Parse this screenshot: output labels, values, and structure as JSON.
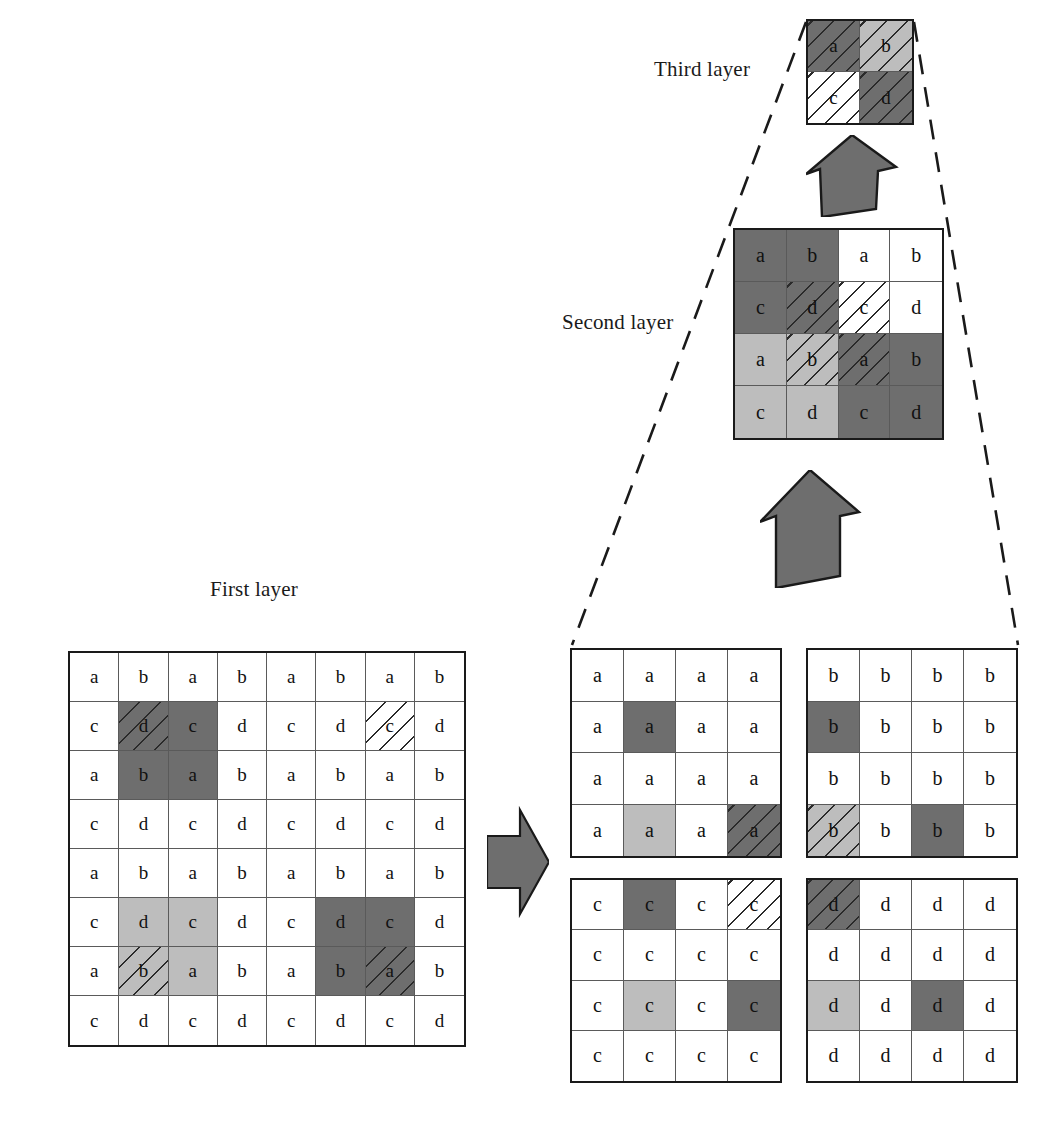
{
  "figure": {
    "labels": {
      "first_layer": "First layer",
      "second_layer": "Second layer",
      "third_layer": "Third layer"
    },
    "colors": {
      "white": "#ffffff",
      "light_gray": "#bdbdbd",
      "dark_gray": "#6e6e6e",
      "line": "#5a5a5a",
      "border": "#1a1a1a",
      "arrow_fill": "#6e6e6e",
      "arrow_stroke": "#1a1a1a"
    },
    "icons": {
      "arrow_right": "arrow-right-icon",
      "arrow_up": "arrow-up-icon",
      "projection_lines": "dashed-projection-lines"
    }
  },
  "chart_data": {
    "type": "diagram",
    "fill_legend": [
      "white",
      "light",
      "dark"
    ],
    "grids": {
      "first_layer": {
        "rows": 8,
        "cols": 8,
        "cells": [
          [
            {
              "t": "a",
              "f": "white",
              "h": false
            },
            {
              "t": "b",
              "f": "white",
              "h": false
            },
            {
              "t": "a",
              "f": "white",
              "h": false
            },
            {
              "t": "b",
              "f": "white",
              "h": false
            },
            {
              "t": "a",
              "f": "white",
              "h": false
            },
            {
              "t": "b",
              "f": "white",
              "h": false
            },
            {
              "t": "a",
              "f": "white",
              "h": false
            },
            {
              "t": "b",
              "f": "white",
              "h": false
            }
          ],
          [
            {
              "t": "c",
              "f": "white",
              "h": false
            },
            {
              "t": "d",
              "f": "dark",
              "h": true
            },
            {
              "t": "c",
              "f": "dark",
              "h": false
            },
            {
              "t": "d",
              "f": "white",
              "h": false
            },
            {
              "t": "c",
              "f": "white",
              "h": false
            },
            {
              "t": "d",
              "f": "white",
              "h": false
            },
            {
              "t": "c",
              "f": "white",
              "h": true
            },
            {
              "t": "d",
              "f": "white",
              "h": false
            }
          ],
          [
            {
              "t": "a",
              "f": "white",
              "h": false
            },
            {
              "t": "b",
              "f": "dark",
              "h": false
            },
            {
              "t": "a",
              "f": "dark",
              "h": false
            },
            {
              "t": "b",
              "f": "white",
              "h": false
            },
            {
              "t": "a",
              "f": "white",
              "h": false
            },
            {
              "t": "b",
              "f": "white",
              "h": false
            },
            {
              "t": "a",
              "f": "white",
              "h": false
            },
            {
              "t": "b",
              "f": "white",
              "h": false
            }
          ],
          [
            {
              "t": "c",
              "f": "white",
              "h": false
            },
            {
              "t": "d",
              "f": "white",
              "h": false
            },
            {
              "t": "c",
              "f": "white",
              "h": false
            },
            {
              "t": "d",
              "f": "white",
              "h": false
            },
            {
              "t": "c",
              "f": "white",
              "h": false
            },
            {
              "t": "d",
              "f": "white",
              "h": false
            },
            {
              "t": "c",
              "f": "white",
              "h": false
            },
            {
              "t": "d",
              "f": "white",
              "h": false
            }
          ],
          [
            {
              "t": "a",
              "f": "white",
              "h": false
            },
            {
              "t": "b",
              "f": "white",
              "h": false
            },
            {
              "t": "a",
              "f": "white",
              "h": false
            },
            {
              "t": "b",
              "f": "white",
              "h": false
            },
            {
              "t": "a",
              "f": "white",
              "h": false
            },
            {
              "t": "b",
              "f": "white",
              "h": false
            },
            {
              "t": "a",
              "f": "white",
              "h": false
            },
            {
              "t": "b",
              "f": "white",
              "h": false
            }
          ],
          [
            {
              "t": "c",
              "f": "white",
              "h": false
            },
            {
              "t": "d",
              "f": "light",
              "h": false
            },
            {
              "t": "c",
              "f": "light",
              "h": false
            },
            {
              "t": "d",
              "f": "white",
              "h": false
            },
            {
              "t": "c",
              "f": "white",
              "h": false
            },
            {
              "t": "d",
              "f": "dark",
              "h": false
            },
            {
              "t": "c",
              "f": "dark",
              "h": false
            },
            {
              "t": "d",
              "f": "white",
              "h": false
            }
          ],
          [
            {
              "t": "a",
              "f": "white",
              "h": false
            },
            {
              "t": "b",
              "f": "light",
              "h": true
            },
            {
              "t": "a",
              "f": "light",
              "h": false
            },
            {
              "t": "b",
              "f": "white",
              "h": false
            },
            {
              "t": "a",
              "f": "white",
              "h": false
            },
            {
              "t": "b",
              "f": "dark",
              "h": false
            },
            {
              "t": "a",
              "f": "dark",
              "h": true
            },
            {
              "t": "b",
              "f": "white",
              "h": false
            }
          ],
          [
            {
              "t": "c",
              "f": "white",
              "h": false
            },
            {
              "t": "d",
              "f": "white",
              "h": false
            },
            {
              "t": "c",
              "f": "white",
              "h": false
            },
            {
              "t": "d",
              "f": "white",
              "h": false
            },
            {
              "t": "c",
              "f": "white",
              "h": false
            },
            {
              "t": "d",
              "f": "white",
              "h": false
            },
            {
              "t": "c",
              "f": "white",
              "h": false
            },
            {
              "t": "d",
              "f": "white",
              "h": false
            }
          ]
        ]
      },
      "sub_a": {
        "rows": 4,
        "cols": 4,
        "cells": [
          [
            {
              "t": "a",
              "f": "white",
              "h": false
            },
            {
              "t": "a",
              "f": "white",
              "h": false
            },
            {
              "t": "a",
              "f": "white",
              "h": false
            },
            {
              "t": "a",
              "f": "white",
              "h": false
            }
          ],
          [
            {
              "t": "a",
              "f": "white",
              "h": false
            },
            {
              "t": "a",
              "f": "dark",
              "h": false
            },
            {
              "t": "a",
              "f": "white",
              "h": false
            },
            {
              "t": "a",
              "f": "white",
              "h": false
            }
          ],
          [
            {
              "t": "a",
              "f": "white",
              "h": false
            },
            {
              "t": "a",
              "f": "white",
              "h": false
            },
            {
              "t": "a",
              "f": "white",
              "h": false
            },
            {
              "t": "a",
              "f": "white",
              "h": false
            }
          ],
          [
            {
              "t": "a",
              "f": "white",
              "h": false
            },
            {
              "t": "a",
              "f": "light",
              "h": false
            },
            {
              "t": "a",
              "f": "white",
              "h": false
            },
            {
              "t": "a",
              "f": "dark",
              "h": true
            }
          ]
        ]
      },
      "sub_b": {
        "rows": 4,
        "cols": 4,
        "cells": [
          [
            {
              "t": "b",
              "f": "white",
              "h": false
            },
            {
              "t": "b",
              "f": "white",
              "h": false
            },
            {
              "t": "b",
              "f": "white",
              "h": false
            },
            {
              "t": "b",
              "f": "white",
              "h": false
            }
          ],
          [
            {
              "t": "b",
              "f": "dark",
              "h": false
            },
            {
              "t": "b",
              "f": "white",
              "h": false
            },
            {
              "t": "b",
              "f": "white",
              "h": false
            },
            {
              "t": "b",
              "f": "white",
              "h": false
            }
          ],
          [
            {
              "t": "b",
              "f": "white",
              "h": false
            },
            {
              "t": "b",
              "f": "white",
              "h": false
            },
            {
              "t": "b",
              "f": "white",
              "h": false
            },
            {
              "t": "b",
              "f": "white",
              "h": false
            }
          ],
          [
            {
              "t": "b",
              "f": "light",
              "h": true
            },
            {
              "t": "b",
              "f": "white",
              "h": false
            },
            {
              "t": "b",
              "f": "dark",
              "h": false
            },
            {
              "t": "b",
              "f": "white",
              "h": false
            }
          ]
        ]
      },
      "sub_c": {
        "rows": 4,
        "cols": 4,
        "cells": [
          [
            {
              "t": "c",
              "f": "white",
              "h": false
            },
            {
              "t": "c",
              "f": "dark",
              "h": false
            },
            {
              "t": "c",
              "f": "white",
              "h": false
            },
            {
              "t": "c",
              "f": "white",
              "h": true
            }
          ],
          [
            {
              "t": "c",
              "f": "white",
              "h": false
            },
            {
              "t": "c",
              "f": "white",
              "h": false
            },
            {
              "t": "c",
              "f": "white",
              "h": false
            },
            {
              "t": "c",
              "f": "white",
              "h": false
            }
          ],
          [
            {
              "t": "c",
              "f": "white",
              "h": false
            },
            {
              "t": "c",
              "f": "light",
              "h": false
            },
            {
              "t": "c",
              "f": "white",
              "h": false
            },
            {
              "t": "c",
              "f": "dark",
              "h": false
            }
          ],
          [
            {
              "t": "c",
              "f": "white",
              "h": false
            },
            {
              "t": "c",
              "f": "white",
              "h": false
            },
            {
              "t": "c",
              "f": "white",
              "h": false
            },
            {
              "t": "c",
              "f": "white",
              "h": false
            }
          ]
        ]
      },
      "sub_d": {
        "rows": 4,
        "cols": 4,
        "cells": [
          [
            {
              "t": "d",
              "f": "dark",
              "h": true
            },
            {
              "t": "d",
              "f": "white",
              "h": false
            },
            {
              "t": "d",
              "f": "white",
              "h": false
            },
            {
              "t": "d",
              "f": "white",
              "h": false
            }
          ],
          [
            {
              "t": "d",
              "f": "white",
              "h": false
            },
            {
              "t": "d",
              "f": "white",
              "h": false
            },
            {
              "t": "d",
              "f": "white",
              "h": false
            },
            {
              "t": "d",
              "f": "white",
              "h": false
            }
          ],
          [
            {
              "t": "d",
              "f": "light",
              "h": false
            },
            {
              "t": "d",
              "f": "white",
              "h": false
            },
            {
              "t": "d",
              "f": "dark",
              "h": false
            },
            {
              "t": "d",
              "f": "white",
              "h": false
            }
          ],
          [
            {
              "t": "d",
              "f": "white",
              "h": false
            },
            {
              "t": "d",
              "f": "white",
              "h": false
            },
            {
              "t": "d",
              "f": "white",
              "h": false
            },
            {
              "t": "d",
              "f": "white",
              "h": false
            }
          ]
        ]
      },
      "second_layer": {
        "rows": 4,
        "cols": 4,
        "cells": [
          [
            {
              "t": "a",
              "f": "dark",
              "h": false
            },
            {
              "t": "b",
              "f": "dark",
              "h": false
            },
            {
              "t": "a",
              "f": "white",
              "h": false
            },
            {
              "t": "b",
              "f": "white",
              "h": false
            }
          ],
          [
            {
              "t": "c",
              "f": "dark",
              "h": false
            },
            {
              "t": "d",
              "f": "dark",
              "h": true
            },
            {
              "t": "c",
              "f": "white",
              "h": true
            },
            {
              "t": "d",
              "f": "white",
              "h": false
            }
          ],
          [
            {
              "t": "a",
              "f": "light",
              "h": false
            },
            {
              "t": "b",
              "f": "light",
              "h": true
            },
            {
              "t": "a",
              "f": "dark",
              "h": true
            },
            {
              "t": "b",
              "f": "dark",
              "h": false
            }
          ],
          [
            {
              "t": "c",
              "f": "light",
              "h": false
            },
            {
              "t": "d",
              "f": "light",
              "h": false
            },
            {
              "t": "c",
              "f": "dark",
              "h": false
            },
            {
              "t": "d",
              "f": "dark",
              "h": false
            }
          ]
        ]
      },
      "third_layer": {
        "rows": 2,
        "cols": 2,
        "cells": [
          [
            {
              "t": "a",
              "f": "dark",
              "h": true
            },
            {
              "t": "b",
              "f": "light",
              "h": true
            }
          ],
          [
            {
              "t": "c",
              "f": "white",
              "h": true
            },
            {
              "t": "d",
              "f": "dark",
              "h": true
            }
          ]
        ]
      }
    }
  }
}
